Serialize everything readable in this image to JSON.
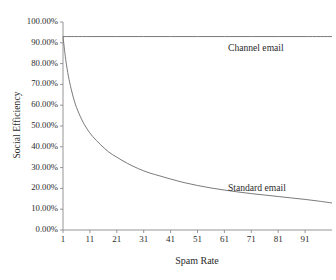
{
  "chart_data": {
    "type": "line",
    "title": "",
    "xlabel": "Spam Rate",
    "ylabel": "Social Efficiency",
    "xlim": [
      1,
      101
    ],
    "ylim": [
      0,
      1
    ],
    "grid": false,
    "legend_position": "inline-annotation",
    "xtick_labels": [
      "1",
      "11",
      "21",
      "31",
      "41",
      "51",
      "61",
      "71",
      "81",
      "91"
    ],
    "xtick_values": [
      1,
      11,
      21,
      31,
      41,
      51,
      61,
      71,
      81,
      91
    ],
    "ytick_labels": [
      "0.00%",
      "10.00%",
      "20.00%",
      "30.00%",
      "40.00%",
      "50.00%",
      "60.00%",
      "70.00%",
      "80.00%",
      "90.00%",
      "100.00%"
    ],
    "ytick_values": [
      0,
      10,
      20,
      30,
      40,
      50,
      60,
      70,
      80,
      90,
      100
    ],
    "series": [
      {
        "name": "Channel email",
        "annotation": "Channel email",
        "color": "#6b6b6b",
        "x": [
          1,
          11,
          21,
          31,
          41,
          51,
          61,
          71,
          81,
          91,
          101
        ],
        "values": [
          93.0,
          93.0,
          93.0,
          93.0,
          93.0,
          93.0,
          93.0,
          93.0,
          93.0,
          93.0,
          93.0
        ]
      },
      {
        "name": "Standard email",
        "annotation": "Standard email",
        "color": "#6b6b6b",
        "x": [
          1,
          2,
          3,
          4,
          5,
          6,
          8,
          10,
          12,
          15,
          18,
          21,
          25,
          29,
          33,
          37,
          41,
          46,
          51,
          56,
          61,
          66,
          71,
          76,
          81,
          86,
          91,
          96,
          101
        ],
        "values": [
          93.0,
          82.0,
          74.0,
          68.0,
          63.0,
          59.0,
          53.0,
          48.5,
          45.0,
          41.0,
          37.5,
          35.0,
          32.0,
          29.5,
          27.5,
          26.0,
          24.5,
          22.8,
          21.4,
          20.2,
          19.2,
          18.3,
          17.5,
          16.8,
          16.1,
          15.4,
          14.7,
          13.9,
          13.0
        ]
      }
    ]
  },
  "axis": {
    "x_title": "Spam Rate",
    "y_title": "Social Efficiency"
  },
  "annotations": {
    "channel": "Channel email",
    "standard": "Standard email"
  },
  "colors": {
    "line": "#6b6b6b",
    "axis": "#8a8a8a",
    "text": "#2b2b2b",
    "background": "#ffffff"
  }
}
